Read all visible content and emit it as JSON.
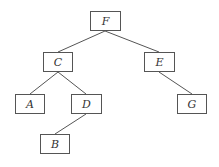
{
  "diagram": {
    "type": "binary-tree",
    "nodes": [
      {
        "id": "F",
        "label": "F",
        "x": 90,
        "y": 11,
        "w": 31,
        "h": 20
      },
      {
        "id": "C",
        "label": "C",
        "x": 43,
        "y": 52,
        "w": 30,
        "h": 20
      },
      {
        "id": "E",
        "label": "E",
        "x": 144,
        "y": 52,
        "w": 31,
        "h": 20
      },
      {
        "id": "A",
        "label": "A",
        "x": 15,
        "y": 94,
        "w": 30,
        "h": 20
      },
      {
        "id": "D",
        "label": "D",
        "x": 71,
        "y": 94,
        "w": 31,
        "h": 20
      },
      {
        "id": "G",
        "label": "G",
        "x": 177,
        "y": 94,
        "w": 30,
        "h": 20
      },
      {
        "id": "B",
        "label": "B",
        "x": 40,
        "y": 134,
        "w": 30,
        "h": 20
      }
    ],
    "edges": [
      {
        "from": "F",
        "to": "C",
        "x1": 105,
        "y1": 31,
        "x2": 58,
        "y2": 52
      },
      {
        "from": "F",
        "to": "E",
        "x1": 105,
        "y1": 31,
        "x2": 159,
        "y2": 52
      },
      {
        "from": "C",
        "to": "A",
        "x1": 58,
        "y1": 72,
        "x2": 30,
        "y2": 94
      },
      {
        "from": "C",
        "to": "D",
        "x1": 58,
        "y1": 72,
        "x2": 86,
        "y2": 94
      },
      {
        "from": "E",
        "to": "G",
        "x1": 159,
        "y1": 72,
        "x2": 192,
        "y2": 94
      },
      {
        "from": "D",
        "to": "B",
        "x1": 86,
        "y1": 114,
        "x2": 55,
        "y2": 134
      }
    ],
    "colors": {
      "stroke": "#555555",
      "text": "#333333",
      "background": "#ffffff"
    }
  }
}
